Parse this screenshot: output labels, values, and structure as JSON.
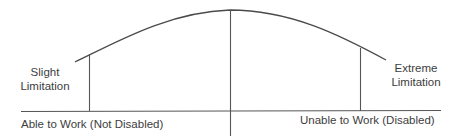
{
  "diagram": {
    "type": "disability-continuum-curve",
    "colors": {
      "line": "#4a4a4a",
      "text": "#3d3d3d",
      "background": "#ffffff"
    },
    "labels": {
      "slight_line1": "Slight",
      "slight_line2": "Limitation",
      "extreme_line1": "Extreme",
      "extreme_line2": "Limitation",
      "left_axis": "Able to Work (Not Disabled)",
      "right_axis": "Unable to Work (Disabled)"
    },
    "elements": {
      "baseline": "horizontal axis line",
      "curve": "bell-shaped arc",
      "left_marker": "vertical line at slight limitation",
      "center_divider": "vertical center divider",
      "right_marker": "vertical line at extreme limitation"
    }
  }
}
